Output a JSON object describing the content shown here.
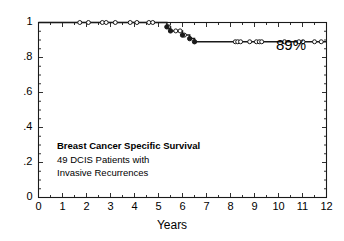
{
  "chart_data": {
    "type": "line",
    "title": "",
    "xlabel": "Years",
    "ylabel": "",
    "xlim": [
      0,
      12
    ],
    "ylim": [
      0,
      1
    ],
    "grid": false,
    "legend": "none",
    "x_ticks": [
      0,
      1,
      2,
      3,
      4,
      5,
      6,
      7,
      8,
      9,
      10,
      11,
      12
    ],
    "x_tick_labels": [
      "0",
      "1",
      "2",
      "3",
      "4",
      "5",
      "6",
      "7",
      "8",
      "9",
      "10",
      "11",
      "12"
    ],
    "x_minor_interval": 0.5,
    "y_ticks": [
      0,
      0.2,
      0.4,
      0.6,
      0.8,
      1
    ],
    "y_tick_labels": [
      "0",
      ".2",
      ".4",
      ".6",
      ".8",
      "1"
    ],
    "y_minor_interval": 0.05,
    "series": [
      {
        "name": "Breast Cancer Specific Survival",
        "kind": "kaplan-meier-step",
        "color": "#1a1a1a",
        "steps": [
          {
            "x": 0.0,
            "y": 1.0
          },
          {
            "x": 5.35,
            "y": 1.0
          },
          {
            "x": 5.35,
            "y": 0.975
          },
          {
            "x": 5.5,
            "y": 0.975
          },
          {
            "x": 5.5,
            "y": 0.952
          },
          {
            "x": 6.0,
            "y": 0.952
          },
          {
            "x": 6.0,
            "y": 0.928
          },
          {
            "x": 6.3,
            "y": 0.928
          },
          {
            "x": 6.3,
            "y": 0.908
          },
          {
            "x": 6.5,
            "y": 0.908
          },
          {
            "x": 6.5,
            "y": 0.89
          },
          {
            "x": 12.0,
            "y": 0.89
          }
        ],
        "events": [
          {
            "x": 5.35,
            "y": 0.975
          },
          {
            "x": 5.5,
            "y": 0.952
          },
          {
            "x": 6.0,
            "y": 0.928
          },
          {
            "x": 6.3,
            "y": 0.908
          },
          {
            "x": 6.5,
            "y": 0.89
          }
        ],
        "censored": [
          {
            "x": 1.72,
            "y": 1.0
          },
          {
            "x": 2.08,
            "y": 1.0
          },
          {
            "x": 2.66,
            "y": 1.0
          },
          {
            "x": 2.82,
            "y": 1.0
          },
          {
            "x": 3.2,
            "y": 1.0
          },
          {
            "x": 3.82,
            "y": 1.0
          },
          {
            "x": 4.1,
            "y": 1.0
          },
          {
            "x": 4.6,
            "y": 1.0
          },
          {
            "x": 4.76,
            "y": 1.0
          },
          {
            "x": 5.42,
            "y": 0.975
          },
          {
            "x": 5.72,
            "y": 0.952
          },
          {
            "x": 5.9,
            "y": 0.952
          },
          {
            "x": 6.08,
            "y": 0.928
          },
          {
            "x": 8.2,
            "y": 0.89
          },
          {
            "x": 8.3,
            "y": 0.89
          },
          {
            "x": 8.42,
            "y": 0.89
          },
          {
            "x": 8.8,
            "y": 0.89
          },
          {
            "x": 9.08,
            "y": 0.89
          },
          {
            "x": 9.2,
            "y": 0.89
          },
          {
            "x": 9.3,
            "y": 0.89
          },
          {
            "x": 10.25,
            "y": 0.89
          },
          {
            "x": 10.85,
            "y": 0.89
          },
          {
            "x": 11.02,
            "y": 0.89
          },
          {
            "x": 11.5,
            "y": 0.89
          },
          {
            "x": 11.78,
            "y": 0.89
          }
        ]
      }
    ],
    "annotations": [
      {
        "name": "final-survival-label",
        "text": "89%",
        "x": 10.9,
        "y": 0.96
      },
      {
        "name": "caption-line-1",
        "text": "Breast Cancer Specific Survival",
        "bold": true
      },
      {
        "name": "caption-line-2",
        "text": "49 DCIS Patients with",
        "bold": false
      },
      {
        "name": "caption-line-3",
        "text": "Invasive Recurrences",
        "bold": false
      }
    ]
  },
  "labels": {
    "final_percent": "89%",
    "caption_line1": "Breast Cancer Specific Survival",
    "caption_line2": "49 DCIS Patients with",
    "caption_line3": "Invasive Recurrences",
    "x_axis_title": "Years"
  },
  "colors": {
    "curve": "#1a1a1a",
    "axis": "#1a1a1a",
    "text": "#000000",
    "background": "#ffffff"
  }
}
